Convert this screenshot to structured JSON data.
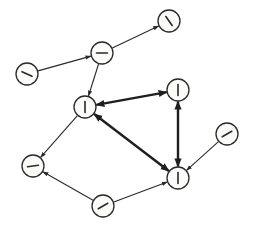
{
  "diagram": {
    "type": "directed-graph",
    "node_radius": 11,
    "colors": {
      "stroke": "#2a2a2a",
      "node_fill": "#fbfbf9",
      "background": "#ffffff"
    },
    "nodes": [
      {
        "id": "n1",
        "x": 169,
        "y": 21,
        "glyph_angle": 55
      },
      {
        "id": "n2",
        "x": 102,
        "y": 53,
        "glyph_angle": 0
      },
      {
        "id": "n3",
        "x": 27,
        "y": 74,
        "glyph_angle": 25
      },
      {
        "id": "n4",
        "x": 85,
        "y": 107,
        "glyph_angle": 90
      },
      {
        "id": "n5",
        "x": 178,
        "y": 90,
        "glyph_angle": 90
      },
      {
        "id": "n6",
        "x": 227,
        "y": 134,
        "glyph_angle": -30
      },
      {
        "id": "n7",
        "x": 178,
        "y": 178,
        "glyph_angle": 90
      },
      {
        "id": "n8",
        "x": 33,
        "y": 166,
        "glyph_angle": -8
      },
      {
        "id": "n9",
        "x": 103,
        "y": 206,
        "glyph_angle": -30
      }
    ],
    "edges": [
      {
        "from": "n3",
        "to": "n2",
        "style": "thin",
        "direction": "forward"
      },
      {
        "from": "n2",
        "to": "n1",
        "style": "thin",
        "direction": "forward"
      },
      {
        "from": "n2",
        "to": "n4",
        "style": "thin",
        "direction": "forward"
      },
      {
        "from": "n4",
        "to": "n5",
        "style": "thick",
        "direction": "both"
      },
      {
        "from": "n4",
        "to": "n7",
        "style": "thick",
        "direction": "both"
      },
      {
        "from": "n5",
        "to": "n7",
        "style": "thick",
        "direction": "both"
      },
      {
        "from": "n6",
        "to": "n7",
        "style": "thin",
        "direction": "forward"
      },
      {
        "from": "n9",
        "to": "n7",
        "style": "thin",
        "direction": "forward"
      },
      {
        "from": "n4",
        "to": "n8",
        "style": "thin",
        "direction": "forward"
      },
      {
        "from": "n9",
        "to": "n8",
        "style": "thin",
        "direction": "forward"
      }
    ]
  }
}
